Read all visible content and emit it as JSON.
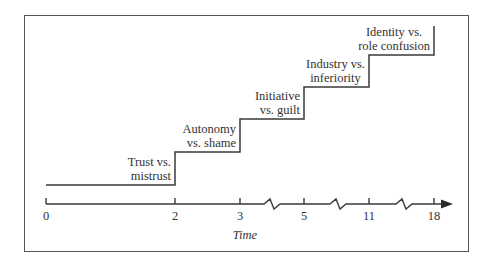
{
  "diagram": {
    "title": "",
    "type": "staircase",
    "axis": {
      "title": "Time",
      "ticks": [
        {
          "value": "0",
          "x": 46
        },
        {
          "value": "2",
          "x": 175
        },
        {
          "value": "3",
          "x": 240
        },
        {
          "value": "5",
          "x": 304
        },
        {
          "value": "11",
          "x": 369
        },
        {
          "value": "18",
          "x": 434
        }
      ],
      "breaks_between": [
        [
          "3",
          "5"
        ],
        [
          "5",
          "11"
        ],
        [
          "11",
          "18"
        ]
      ]
    },
    "stages": [
      {
        "line1": "Trust vs.",
        "line2": "mistrust",
        "from": "0",
        "to": "2"
      },
      {
        "line1": "Autonomy",
        "line2": "vs. shame",
        "from": "2",
        "to": "3"
      },
      {
        "line1": "Initiative",
        "line2": "vs. guilt",
        "from": "3",
        "to": "5"
      },
      {
        "line1": "Industry vs.",
        "line2": "inferiority",
        "from": "5",
        "to": "11"
      },
      {
        "line1": "Identity vs.",
        "line2": "role confusion",
        "from": "11",
        "to": "18"
      }
    ],
    "colors": {
      "line": "#3a3a3a",
      "frame": "#555555",
      "background": "#ffffff"
    }
  }
}
